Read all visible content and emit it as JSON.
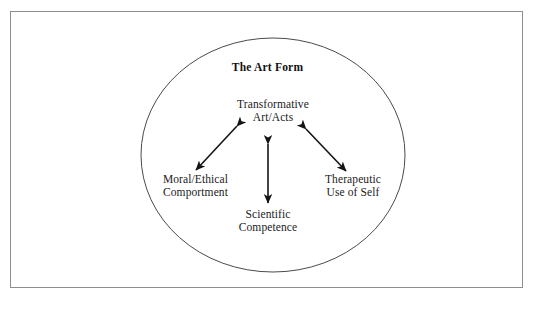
{
  "figure": {
    "container_title": "The Art Form",
    "shape": "ellipse",
    "border": "#8d8d8d",
    "ink": "#1b1b1b"
  },
  "nodes": {
    "center": {
      "line1": "Transformative",
      "line2": "Art/Acts"
    },
    "left": {
      "line1": "Moral/Ethical",
      "line2": "Comportment"
    },
    "bottom": {
      "line1": "Scientific",
      "line2": "Competence"
    },
    "right": {
      "line1": "Therapeutic",
      "line2": "Use of Self"
    }
  },
  "connectors": [
    {
      "name": "center-to-left",
      "style": "double-headed-arrow"
    },
    {
      "name": "center-to-bottom",
      "style": "double-headed-arrow"
    },
    {
      "name": "center-to-right",
      "style": "double-headed-arrow"
    }
  ]
}
